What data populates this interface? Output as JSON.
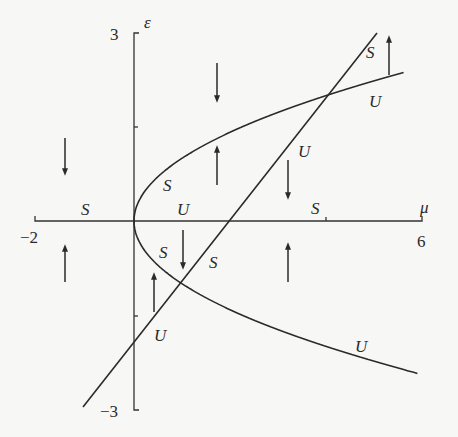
{
  "diagram": {
    "type": "bifurcation-diagram",
    "axes": {
      "x_label": "μ",
      "y_label": "ε",
      "x_min_label": "−2",
      "x_max_label": "6",
      "y_max_label": "3",
      "y_min_label": "−3",
      "x_range": [
        -2,
        6
      ],
      "y_range": [
        -3,
        3
      ],
      "x_ticks": [
        4
      ],
      "y_ticks": [
        1.5,
        -1.5
      ]
    },
    "curves": [
      {
        "name": "parabola",
        "equation": "μ = ε²"
      },
      {
        "name": "line",
        "equation": "ε = μ − 2"
      }
    ],
    "intersections": [
      {
        "mu": 1,
        "epsilon": -1
      },
      {
        "mu": 4,
        "epsilon": 2
      }
    ],
    "stability_labels": [
      {
        "text": "S",
        "region": "negative-mu-axis"
      },
      {
        "text": "S",
        "region": "parabola-upper-near-origin"
      },
      {
        "text": "U",
        "region": "mu-axis-between-0-and-2"
      },
      {
        "text": "U",
        "region": "line-between-axis-and-upper-crossing"
      },
      {
        "text": "S",
        "region": "mu-axis-beyond-2"
      },
      {
        "text": "S",
        "region": "line-above-upper-crossing"
      },
      {
        "text": "U",
        "region": "parabola-upper-beyond-crossing"
      },
      {
        "text": "S",
        "region": "parabola-lower-near-origin"
      },
      {
        "text": "S",
        "region": "line-between-lower-crossing-and-axis"
      },
      {
        "text": "U",
        "region": "line-below-lower-crossing"
      },
      {
        "text": "U",
        "region": "parabola-lower-beyond-crossing"
      }
    ],
    "flow_arrows": [
      {
        "direction": "down",
        "region": "left-upper"
      },
      {
        "direction": "up",
        "region": "left-lower"
      },
      {
        "direction": "down",
        "region": "above-parabola-center"
      },
      {
        "direction": "up",
        "region": "inside-parabola-upper"
      },
      {
        "direction": "down",
        "region": "right-of-line-upper"
      },
      {
        "direction": "up",
        "region": "right-lower"
      },
      {
        "direction": "up",
        "region": "inside-parabola-lower-left"
      },
      {
        "direction": "down",
        "region": "inside-parabola-lower-right"
      },
      {
        "direction": "up",
        "region": "top-right"
      }
    ],
    "colors": {
      "ink": "#2a2a2a",
      "background": "#f7f7f5"
    }
  }
}
